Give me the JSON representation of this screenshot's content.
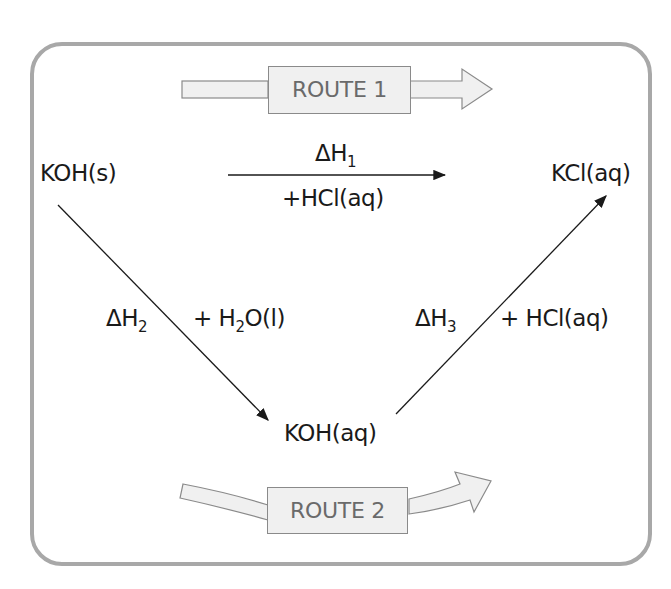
{
  "diagram": {
    "type": "hess-cycle",
    "route1": {
      "label": "ROUTE 1"
    },
    "route2": {
      "label": "ROUTE 2"
    },
    "nodes": {
      "start": "KOH(s)",
      "end": "KCl(aq)",
      "intermediate": "KOH(aq)"
    },
    "edges": {
      "direct": {
        "enthalpy_symbol": "ΔH",
        "enthalpy_sub": "1",
        "reagent": "+HCl(aq)"
      },
      "step1": {
        "enthalpy_symbol": "ΔH",
        "enthalpy_sub": "2",
        "reagent_prefix": "+  H",
        "reagent_sub": "2",
        "reagent_suffix": "O(l)"
      },
      "step2": {
        "enthalpy_symbol": "ΔH",
        "enthalpy_sub": "3",
        "reagent": "+  HCl(aq)"
      }
    }
  }
}
